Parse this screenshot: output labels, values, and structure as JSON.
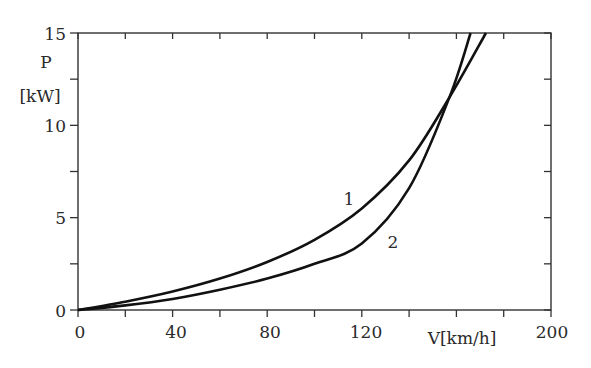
{
  "chart_data": {
    "type": "line",
    "title": "",
    "xlabel": "V[km/h]",
    "ylabel_line1": "P",
    "ylabel_line2": "[kW]",
    "xlim": [
      0,
      200
    ],
    "ylim": [
      0,
      15
    ],
    "x_ticks": [
      0,
      40,
      80,
      120,
      200
    ],
    "x_tick_labels": [
      "0",
      "40",
      "80",
      "120",
      "200"
    ],
    "x_minor_ticks": [
      20,
      60,
      100,
      140,
      160,
      180
    ],
    "y_ticks": [
      0,
      5,
      10,
      15
    ],
    "y_tick_labels": [
      "0",
      "5",
      "10",
      "15"
    ],
    "y_minor_ticks": [
      2.5,
      7.5,
      12.5
    ],
    "grid": false,
    "legend": "inline labels",
    "series": [
      {
        "name": "1",
        "x": [
          0,
          20,
          40,
          60,
          80,
          100,
          120,
          140,
          157,
          172.5
        ],
        "y": [
          0,
          0.45,
          1.0,
          1.7,
          2.6,
          3.8,
          5.5,
          8.1,
          11.5,
          15
        ]
      },
      {
        "name": "2",
        "x": [
          0,
          20,
          40,
          60,
          80,
          100,
          120,
          140,
          157,
          166
        ],
        "y": [
          0,
          0.25,
          0.6,
          1.1,
          1.7,
          2.5,
          3.6,
          6.6,
          11.5,
          15
        ]
      }
    ],
    "annotations": [
      {
        "text": "1",
        "x": 112,
        "y": 6.0
      },
      {
        "text": "2",
        "x": 133,
        "y": 3.8
      }
    ]
  },
  "labels": {
    "x_axis_title": "V[km/h]",
    "y_axis_title_p": "P",
    "y_axis_title_unit": "[kW]",
    "curve1": "1",
    "curve2": "2",
    "xt0": "0",
    "xt40": "40",
    "xt80": "80",
    "xt120": "120",
    "xt200": "200",
    "yt0": "0",
    "yt5": "5",
    "yt10": "10",
    "yt15": "15"
  }
}
